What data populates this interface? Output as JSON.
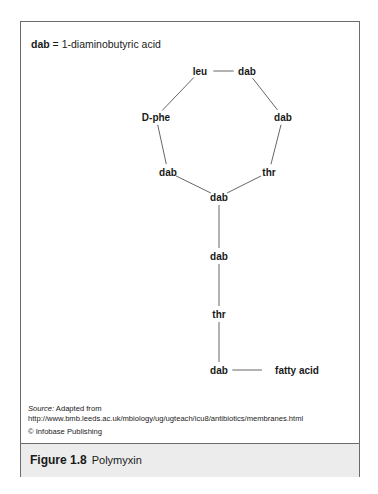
{
  "legend": {
    "abbr": "dab",
    "definition": " = 1-diaminobutyric acid"
  },
  "diagram": {
    "nodes": [
      {
        "id": "leu",
        "label": "leu",
        "x": 179,
        "y": 49
      },
      {
        "id": "dab1",
        "label": "dab",
        "x": 226,
        "y": 49
      },
      {
        "id": "dab2",
        "label": "dab",
        "x": 262,
        "y": 95
      },
      {
        "id": "thr1",
        "label": "thr",
        "x": 248,
        "y": 150
      },
      {
        "id": "dab3",
        "label": "dab",
        "x": 198,
        "y": 175
      },
      {
        "id": "dab4",
        "label": "dab",
        "x": 147,
        "y": 150
      },
      {
        "id": "dphe",
        "label": "D-phe",
        "x": 135,
        "y": 95
      },
      {
        "id": "dab5",
        "label": "dab",
        "x": 198,
        "y": 234
      },
      {
        "id": "thr2",
        "label": "thr",
        "x": 198,
        "y": 292
      },
      {
        "id": "dab6",
        "label": "dab",
        "x": 198,
        "y": 348
      },
      {
        "id": "fatty",
        "label": "fatty acid",
        "x": 276,
        "y": 348
      }
    ],
    "edges": [
      [
        "leu",
        "dab1"
      ],
      [
        "dab1",
        "dab2"
      ],
      [
        "dab2",
        "thr1"
      ],
      [
        "thr1",
        "dab3"
      ],
      [
        "dab3",
        "dab4"
      ],
      [
        "dab4",
        "dphe"
      ],
      [
        "dphe",
        "leu"
      ],
      [
        "dab3",
        "dab5"
      ],
      [
        "dab5",
        "thr2"
      ],
      [
        "thr2",
        "dab6"
      ],
      [
        "dab6",
        "fatty"
      ]
    ]
  },
  "source": {
    "label": "Source:",
    "text": " Adapted from",
    "url": "http://www.bmb.leeds.ac.uk/mbiology/ug/ugteach/icu8/antibiotics/membranes.html"
  },
  "copyright": "© Infobase Publishing",
  "figure": {
    "number": "Figure 1.8",
    "title": "Polymyxin"
  }
}
